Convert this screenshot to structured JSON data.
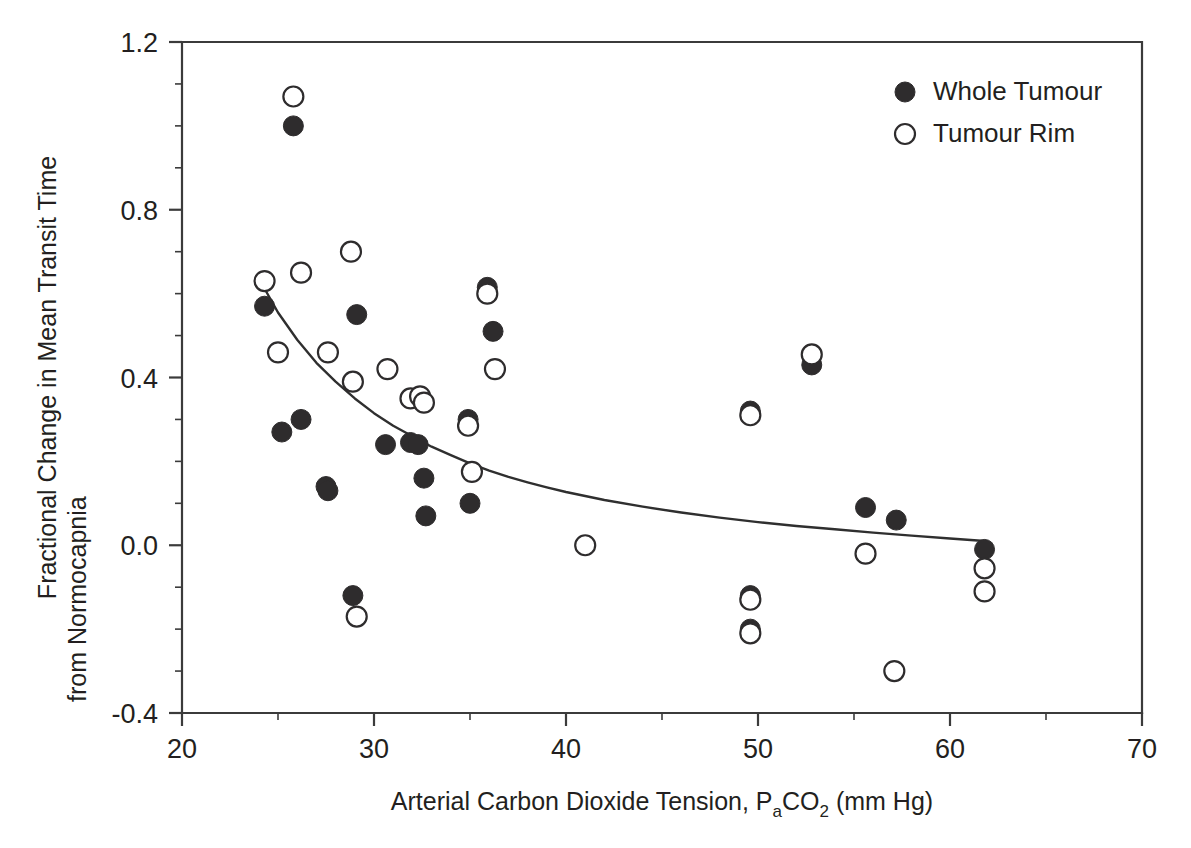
{
  "chart_data": {
    "type": "scatter",
    "title": "",
    "xlabel": "Arterial Carbon Dioxide Tension, PaCO2 (mm Hg)",
    "xlabel_parts": {
      "lead": "Arterial Carbon Dioxide Tension, P",
      "sub1": "a",
      "mid": "CO",
      "sub2": "2",
      "tail": " (mm Hg)"
    },
    "ylabel": "Fractional Change in Mean Transit Time from Normocapnia",
    "ylabel_line1": "Fractional Change in Mean Transit Time",
    "ylabel_line2": "from Normocapnia",
    "xlim": [
      20,
      70
    ],
    "ylim": [
      -0.4,
      1.2
    ],
    "xticks": [
      20,
      30,
      40,
      50,
      60,
      70
    ],
    "xtick_labels": [
      "20",
      "30",
      "40",
      "50",
      "60",
      "70"
    ],
    "xminor_step": 5,
    "yticks": [
      -0.4,
      0.0,
      0.4,
      0.8,
      1.2
    ],
    "ytick_labels": [
      "-0.4",
      "0.0",
      "0.4",
      "0.8",
      "1.2"
    ],
    "yminor_step": 0.1,
    "grid": false,
    "legend_position": "top-right",
    "marker_radius": 10,
    "series": [
      {
        "name": "Whole Tumour",
        "marker": "filled-circle",
        "color": "#2e2c2d",
        "points": [
          [
            24.3,
            0.57
          ],
          [
            25.8,
            1.0
          ],
          [
            26.2,
            0.3
          ],
          [
            25.2,
            0.27
          ],
          [
            27.5,
            0.14
          ],
          [
            27.6,
            0.13
          ],
          [
            28.9,
            -0.12
          ],
          [
            29.1,
            0.55
          ],
          [
            30.6,
            0.24
          ],
          [
            31.9,
            0.245
          ],
          [
            32.3,
            0.24
          ],
          [
            32.6,
            0.16
          ],
          [
            32.7,
            0.07
          ],
          [
            34.9,
            0.3
          ],
          [
            35.0,
            0.1
          ],
          [
            35.9,
            0.615
          ],
          [
            36.2,
            0.51
          ],
          [
            49.6,
            0.32
          ],
          [
            49.6,
            -0.12
          ],
          [
            49.6,
            -0.2
          ],
          [
            52.8,
            0.43
          ],
          [
            55.6,
            0.09
          ],
          [
            57.2,
            0.06
          ],
          [
            61.8,
            -0.01
          ]
        ]
      },
      {
        "name": "Tumour Rim",
        "marker": "open-circle",
        "color": "#2e2c2d",
        "points": [
          [
            24.3,
            0.63
          ],
          [
            25.0,
            0.46
          ],
          [
            25.8,
            1.07
          ],
          [
            26.2,
            0.65
          ],
          [
            27.6,
            0.46
          ],
          [
            28.8,
            0.7
          ],
          [
            28.9,
            0.39
          ],
          [
            29.1,
            -0.17
          ],
          [
            30.7,
            0.42
          ],
          [
            31.9,
            0.35
          ],
          [
            32.4,
            0.355
          ],
          [
            32.6,
            0.34
          ],
          [
            34.9,
            0.285
          ],
          [
            35.1,
            0.175
          ],
          [
            35.9,
            0.6
          ],
          [
            36.3,
            0.42
          ],
          [
            41.0,
            0.0
          ],
          [
            49.6,
            0.31
          ],
          [
            49.6,
            -0.13
          ],
          [
            49.6,
            -0.21
          ],
          [
            52.8,
            0.455
          ],
          [
            55.6,
            -0.02
          ],
          [
            57.1,
            -0.3
          ],
          [
            61.8,
            -0.055
          ],
          [
            61.8,
            -0.11
          ]
        ]
      }
    ],
    "fit_curve": {
      "label": "exponential decay fit",
      "points": [
        [
          24.2,
          0.62
        ],
        [
          25.0,
          0.555
        ],
        [
          26.0,
          0.49
        ],
        [
          27.0,
          0.435
        ],
        [
          28.0,
          0.39
        ],
        [
          29.0,
          0.35
        ],
        [
          30.0,
          0.315
        ],
        [
          31.0,
          0.285
        ],
        [
          32.0,
          0.26
        ],
        [
          33.0,
          0.235
        ],
        [
          34.0,
          0.215
        ],
        [
          35.0,
          0.195
        ],
        [
          36.0,
          0.178
        ],
        [
          37.0,
          0.163
        ],
        [
          38.0,
          0.15
        ],
        [
          39.0,
          0.138
        ],
        [
          40.0,
          0.127
        ],
        [
          42.0,
          0.108
        ],
        [
          44.0,
          0.092
        ],
        [
          46.0,
          0.078
        ],
        [
          48.0,
          0.066
        ],
        [
          50.0,
          0.055
        ],
        [
          52.0,
          0.046
        ],
        [
          54.0,
          0.038
        ],
        [
          56.0,
          0.03
        ],
        [
          58.0,
          0.023
        ],
        [
          60.0,
          0.016
        ],
        [
          61.8,
          0.01
        ]
      ]
    },
    "legend": [
      {
        "label": "Whole Tumour",
        "marker": "filled-circle"
      },
      {
        "label": "Tumour Rim",
        "marker": "open-circle"
      }
    ]
  }
}
